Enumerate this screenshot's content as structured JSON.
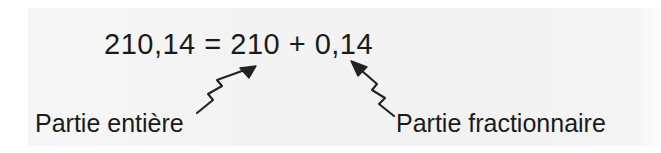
{
  "figure": {
    "equation": "210,14 = 210 + 0,14",
    "equation_parts": {
      "decimal_number": "210,14",
      "equals_sign": "=",
      "integer_part": "210",
      "plus_sign": "+",
      "fractional_part": "0,14"
    },
    "labels": {
      "integer_label": "Partie entière",
      "fraction_label": "Partie fractionnaire"
    },
    "annotations": [
      {
        "name": "arrow-to-integer-part",
        "from_label": "Partie entière",
        "points_to": "210",
        "direction": "up-right"
      },
      {
        "name": "arrow-to-fractional-part",
        "from_label": "Partie fractionnaire",
        "points_to": "0,14",
        "direction": "up-left"
      }
    ],
    "colors": {
      "background": "#ffffff",
      "panel": "#f4f4f4",
      "text": "#1b1b1b",
      "arrow": "#222222"
    }
  }
}
